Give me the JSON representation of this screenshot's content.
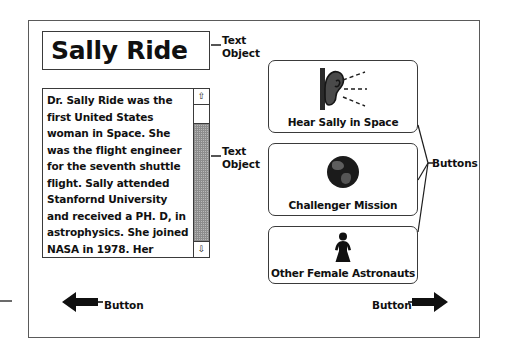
{
  "card": {
    "title": {
      "text": "Sally Ride"
    },
    "body": {
      "text": "Dr. Sally Ride was the first United States woman in Space.  She was the flight engineer for the seventh shuttle flight.  Sally attended Stanfornd University and received a PH. D, in astrophysics. She joined NASA in 1978. Her position was",
      "scroll_up_glyph": "⇧",
      "scroll_down_glyph": "⇩"
    },
    "buttons": [
      {
        "id": "hear-sally-in-space",
        "label": "Hear Sally in Space",
        "icon": "ear-icon"
      },
      {
        "id": "challenger-mission",
        "label": "Challenger Mission",
        "icon": "globe-icon"
      },
      {
        "id": "other-female-astronauts",
        "label": "Other Female Astronauts",
        "icon": "female-figure-icon"
      }
    ],
    "nav": {
      "back_label": "Button",
      "back_icon": "left-arrow-icon",
      "forward_label": "Button",
      "forward_icon": "right-arrow-icon"
    }
  },
  "annotations": {
    "title_object": "Text\nObject",
    "body_object": "Text\nObject",
    "buttons_group": "Buttons"
  },
  "colors": {
    "ink": "#101010",
    "frame": "#5a5a5a",
    "box_border": "#3a3a3a",
    "globe_fill": "#1b1b1b",
    "scroll_track": "#b9b9b9",
    "page_background": "#ffffff"
  }
}
